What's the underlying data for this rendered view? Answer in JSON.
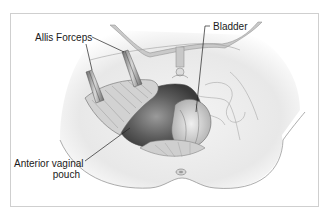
{
  "figure": {
    "type": "anatomical illustration",
    "labels": [
      {
        "id": "allis-forceps",
        "text": "Allis Forceps"
      },
      {
        "id": "bladder",
        "text": "Bladder"
      },
      {
        "id": "anterior-vaginal-pouch",
        "text": "Anterior vaginal pouch",
        "line1": "Anterior vaginal",
        "line2": "pouch"
      }
    ]
  },
  "colors": {
    "frame_border": "#cfcfcf",
    "outline": "#8a8a8a",
    "tissue_fill": "#ececec",
    "dark_cavity": "#5a5a5a",
    "leader_line": "#222222"
  }
}
